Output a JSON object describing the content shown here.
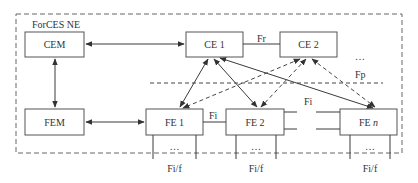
{
  "diagram": {
    "frame_label": "ForCES NE",
    "nodes": {
      "cem": "CEM",
      "ce1": "CE 1",
      "ce2": "CE 2",
      "fem": "FEM",
      "fe1": "FE 1",
      "fe2": "FE 2",
      "fen_prefix": "FE ",
      "fen_suffix": "n"
    },
    "interfaces": {
      "fr": "Fr",
      "fp": "Fp",
      "fi_fe1_fe2": "Fi",
      "fi_fe2_fen": "Fi",
      "fif_fe1": "Fi/f",
      "fif_fe2": "Fi/f",
      "fif_fen": "Fi/f"
    },
    "ellipsis": {
      "ce": "…",
      "fe1": "…",
      "fe2": "…",
      "fen": "…"
    },
    "colors": {
      "line": "#3a3a3a",
      "box_stroke": "#555555",
      "text": "#333333",
      "background": "#ffffff"
    }
  }
}
